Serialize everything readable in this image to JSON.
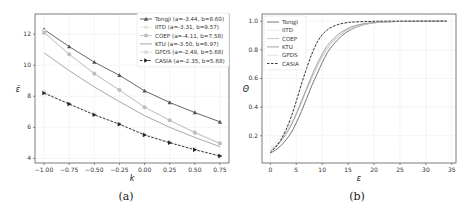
{
  "figure": {
    "panels": [
      {
        "caption": "(a)"
      },
      {
        "caption": "(b)"
      }
    ]
  },
  "chart_data": [
    {
      "type": "line",
      "panel": "(a)",
      "xlabel": "k",
      "ylabel": "ε̄",
      "x": [
        -1.0,
        -0.75,
        -0.5,
        -0.25,
        0.0,
        0.25,
        0.5,
        0.75
      ],
      "xticks": [
        "−1.00",
        "−0.75",
        "−0.50",
        "−0.25",
        "0.00",
        "0.25",
        "0.50",
        "0.75"
      ],
      "yticks": [
        "4",
        "6",
        "8",
        "10",
        "12"
      ],
      "ylim": [
        3.7,
        13.3
      ],
      "xlim": [
        -1.09,
        0.84
      ],
      "grid": true,
      "legend_position": "upper right",
      "series": [
        {
          "name": "Tongji (a=-3.44, b=8.60)",
          "color": "#555555",
          "marker": "triangle",
          "dash": false,
          "values": [
            12.3,
            11.2,
            10.2,
            9.35,
            8.35,
            7.6,
            6.95,
            6.35
          ]
        },
        {
          "name": "IITD (a=-3.31, b=9.57)",
          "color": "#e6e6e6",
          "marker": "circle",
          "dash": false,
          "values": [
            12.2,
            10.7,
            9.5,
            8.4,
            7.3,
            6.45,
            5.7,
            5.0
          ]
        },
        {
          "name": "COEP (a=-4.11, b=7.58)",
          "color": "#bdbdbd",
          "marker": "circle",
          "dash": false,
          "values": [
            12.1,
            10.7,
            9.45,
            8.4,
            7.3,
            6.45,
            5.65,
            4.95
          ]
        },
        {
          "name": "KTU (a=-3.50, b=6.97)",
          "color": "#9e9e9e",
          "marker": "none",
          "dash": false,
          "values": [
            10.8,
            9.65,
            8.6,
            7.65,
            6.75,
            6.0,
            5.35,
            4.75
          ]
        },
        {
          "name": "GPDS (a=-2.49, b=5.68)",
          "color": "#dddddd",
          "marker": "square",
          "dash": false,
          "values": [
            8.3,
            7.5,
            6.85,
            6.2,
            5.55,
            5.05,
            4.6,
            4.15
          ]
        },
        {
          "name": "CASIA (a=-2.35, b=5.68)",
          "color": "#222222",
          "marker": "triangle-right",
          "dash": true,
          "values": [
            8.2,
            7.5,
            6.8,
            6.2,
            5.5,
            5.0,
            4.55,
            4.15
          ]
        }
      ]
    },
    {
      "type": "line",
      "panel": "(b)",
      "xlabel": "ε",
      "ylabel": "Θ",
      "xticks": [
        "0",
        "5",
        "10",
        "15",
        "20",
        "25",
        "30",
        "35"
      ],
      "yticks": [
        "0.2",
        "0.4",
        "0.6",
        "0.8",
        "1.0"
      ],
      "xlim": [
        -1.6,
        35.8
      ],
      "ylim": [
        0.01,
        1.05
      ],
      "grid": true,
      "legend_position": "upper left",
      "x": [
        0,
        1,
        2,
        3,
        4,
        5,
        6,
        7,
        8,
        9,
        10,
        11,
        12,
        13,
        14,
        15,
        16,
        18,
        20,
        22,
        25,
        28,
        31,
        34
      ],
      "series": [
        {
          "name": "Tongji",
          "color": "#666666",
          "dash": false,
          "values": [
            0.08,
            0.1,
            0.13,
            0.17,
            0.22,
            0.29,
            0.37,
            0.46,
            0.55,
            0.63,
            0.71,
            0.78,
            0.83,
            0.87,
            0.905,
            0.93,
            0.95,
            0.975,
            0.988,
            0.994,
            0.998,
            0.999,
            1.0,
            1.0
          ]
        },
        {
          "name": "IITD",
          "color": "#e8e8e8",
          "dash": false,
          "values": [
            0.12,
            0.15,
            0.19,
            0.24,
            0.3,
            0.37,
            0.45,
            0.53,
            0.61,
            0.68,
            0.75,
            0.81,
            0.85,
            0.89,
            0.92,
            0.94,
            0.955,
            0.977,
            0.989,
            0.995,
            0.998,
            0.999,
            1.0,
            1.0
          ]
        },
        {
          "name": "COEP",
          "color": "#c4c4c4",
          "dash": false,
          "values": [
            0.1,
            0.13,
            0.17,
            0.22,
            0.28,
            0.35,
            0.43,
            0.52,
            0.6,
            0.68,
            0.75,
            0.81,
            0.86,
            0.89,
            0.92,
            0.945,
            0.96,
            0.98,
            0.99,
            0.995,
            0.998,
            0.999,
            1.0,
            1.0
          ]
        },
        {
          "name": "KTU",
          "color": "#9a9a9a",
          "dash": false,
          "values": [
            0.09,
            0.12,
            0.16,
            0.21,
            0.27,
            0.35,
            0.44,
            0.53,
            0.62,
            0.7,
            0.77,
            0.83,
            0.87,
            0.905,
            0.93,
            0.95,
            0.965,
            0.982,
            0.991,
            0.996,
            0.998,
            0.999,
            1.0,
            1.0
          ]
        },
        {
          "name": "GPDS",
          "color": "#dedede",
          "dash": false,
          "values": [
            0.08,
            0.12,
            0.17,
            0.24,
            0.33,
            0.44,
            0.56,
            0.67,
            0.77,
            0.85,
            0.9,
            0.94,
            0.96,
            0.975,
            0.985,
            0.99,
            0.994,
            0.997,
            0.999,
            1.0,
            1.0,
            1.0,
            1.0,
            1.0
          ]
        },
        {
          "name": "CASIA",
          "color": "#222222",
          "dash": true,
          "values": [
            0.08,
            0.12,
            0.17,
            0.24,
            0.33,
            0.44,
            0.56,
            0.67,
            0.77,
            0.85,
            0.905,
            0.94,
            0.962,
            0.976,
            0.985,
            0.991,
            0.994,
            0.997,
            0.999,
            1.0,
            1.0,
            1.0,
            1.0,
            1.0
          ]
        }
      ]
    }
  ]
}
